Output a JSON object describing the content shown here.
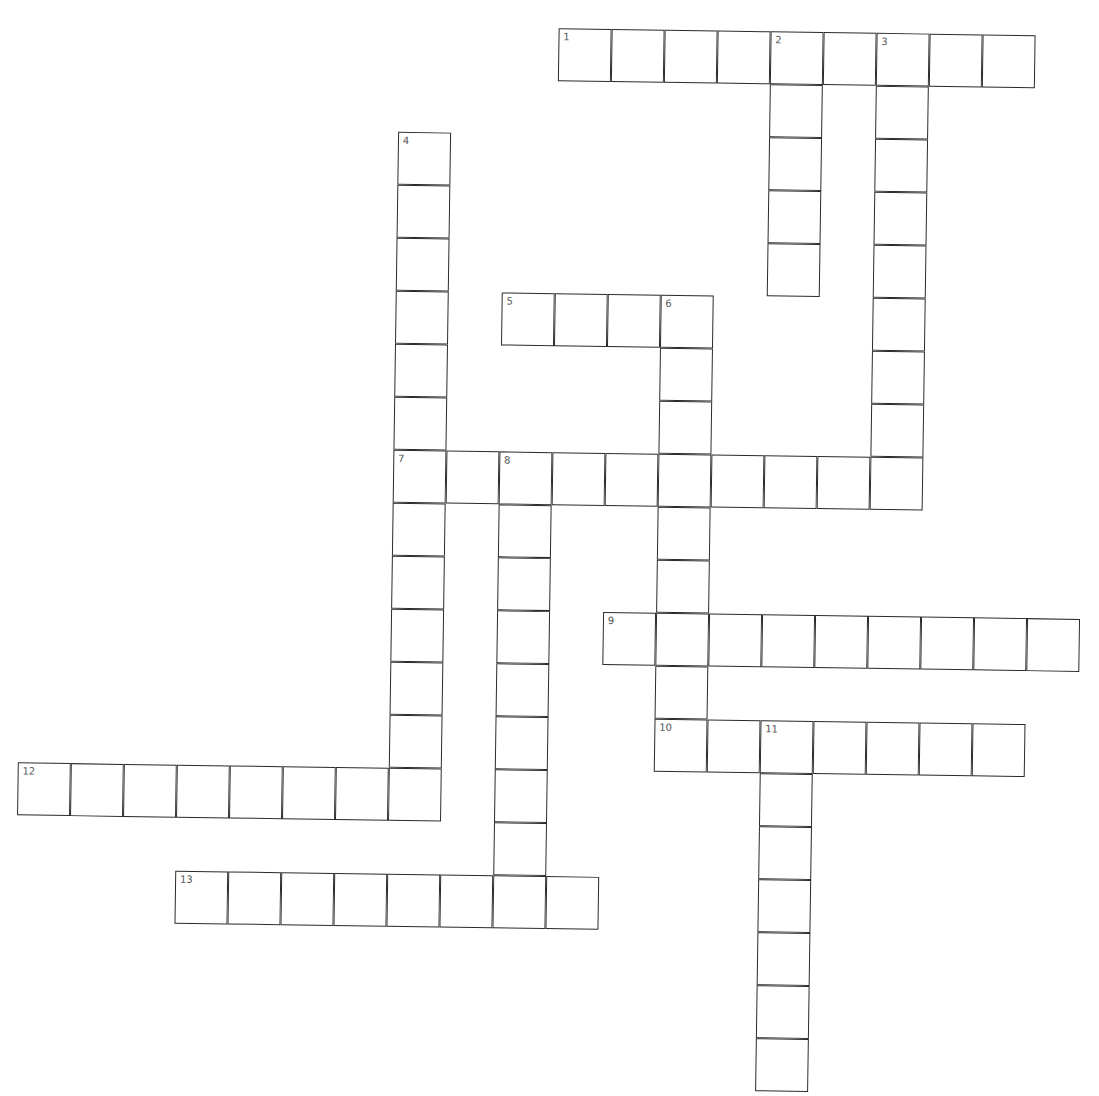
{
  "puzzle": {
    "cell_size": 53,
    "origin": [
      28.8,
      19.9
    ],
    "words": [
      {
        "number": "1",
        "direction": "across",
        "row": 0,
        "col": 10,
        "length": 9
      },
      {
        "number": "2",
        "direction": "down",
        "row": 0,
        "col": 14,
        "length": 5
      },
      {
        "number": "3",
        "direction": "down",
        "row": 0,
        "col": 16,
        "length": 9
      },
      {
        "number": "4",
        "direction": "down",
        "row": 2,
        "col": 7,
        "length": 13
      },
      {
        "number": "5",
        "direction": "across",
        "row": 5,
        "col": 9,
        "length": 4
      },
      {
        "number": "6",
        "direction": "down",
        "row": 5,
        "col": 12,
        "length": 9
      },
      {
        "number": "7",
        "direction": "across",
        "row": 8,
        "col": 7,
        "length": 10
      },
      {
        "number": "8",
        "direction": "down",
        "row": 8,
        "col": 9,
        "length": 9
      },
      {
        "number": "9",
        "direction": "across",
        "row": 11,
        "col": 11,
        "length": 9
      },
      {
        "number": "10",
        "direction": "across",
        "row": 13,
        "col": 12,
        "length": 7
      },
      {
        "number": "11",
        "direction": "down",
        "row": 13,
        "col": 14,
        "length": 7
      },
      {
        "number": "12",
        "direction": "across",
        "row": 14,
        "col": 0,
        "length": 8
      },
      {
        "number": "13",
        "direction": "across",
        "row": 16,
        "col": 3,
        "length": 8
      }
    ]
  },
  "colors": {
    "line": "#2b2b2b",
    "number": "#555555",
    "background": "#ffffff"
  }
}
